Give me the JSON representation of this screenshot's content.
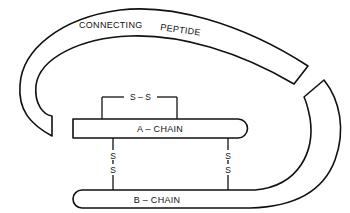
{
  "diagram": {
    "labels": {
      "connecting_peptide_1": "CONNECTING",
      "connecting_peptide_2": "PEPTIDE",
      "a_chain": "A – CHAIN",
      "b_chain": "B – CHAIN",
      "intra_bridge": "S – S",
      "s": "S"
    },
    "colors": {
      "stroke": "#111111",
      "background": "#ffffff"
    }
  }
}
